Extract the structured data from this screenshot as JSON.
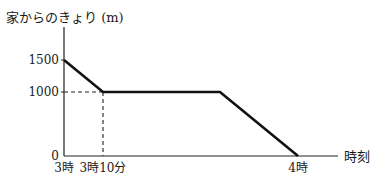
{
  "chart_data": {
    "type": "line",
    "title": "",
    "ylabel": "家からのきょり (m)",
    "xlabel": "時刻",
    "x_unit": "minutes after 3時",
    "xlim": [
      0,
      60
    ],
    "ylim": [
      0,
      1500
    ],
    "grid": false,
    "legend": "none",
    "series": [
      {
        "name": "distance",
        "points": [
          {
            "x": 0,
            "y": 1500
          },
          {
            "x": 10,
            "y": 1000
          },
          {
            "x": 40,
            "y": 1000
          },
          {
            "x": 60,
            "y": 0
          }
        ]
      }
    ],
    "y_ticks": [
      {
        "value": 1500,
        "label": "1500"
      },
      {
        "value": 1000,
        "label": "1000"
      },
      {
        "value": 0,
        "label": "0"
      }
    ],
    "x_ticks": [
      {
        "value": 0,
        "label": "3時"
      },
      {
        "value": 10,
        "label": "3時10分"
      },
      {
        "value": 60,
        "label": "4時"
      }
    ],
    "guides": [
      {
        "type": "dashed",
        "from": {
          "x": 0,
          "y": 1000
        },
        "to": {
          "x": 10,
          "y": 1000
        }
      },
      {
        "type": "dashed",
        "from": {
          "x": 10,
          "y": 1000
        },
        "to": {
          "x": 10,
          "y": 0
        }
      }
    ],
    "colors": {
      "line": "#111111",
      "axis": "#222222"
    }
  }
}
